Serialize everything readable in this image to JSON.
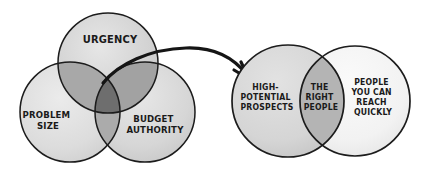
{
  "diagram": {
    "background_color": "#ffffff",
    "ink_color": "#1c1c1c",
    "left_venn": {
      "name": "qualification-criteria-venn",
      "circles": [
        {
          "id": "urgency",
          "label": "URGENCY",
          "lines": [
            "URGENCY"
          ],
          "fill": "#d2d2d2",
          "cx": 108,
          "cy": 63,
          "r": 50
        },
        {
          "id": "problem-size",
          "label": "PROBLEM SIZE",
          "lines": [
            "PROBLEM",
            "SIZE"
          ],
          "fill": "#dcdcdc",
          "cx": 70,
          "cy": 112,
          "r": 50
        },
        {
          "id": "budget-authority",
          "label": "BUDGET AUTHORITY",
          "lines": [
            "BUDGET",
            "AUTHORITY"
          ],
          "fill": "#d6d6d6",
          "cx": 145,
          "cy": 112,
          "r": 50
        }
      ],
      "overlap_fill": "#8e8e8e",
      "center_fill": "#6e6e6e"
    },
    "arrow": {
      "name": "flow-arrow",
      "from": "left-venn-center-intersection",
      "to": "right-venn-left-circle",
      "stroke_color": "#151515",
      "stroke_width": 3.2,
      "start_x": 103,
      "start_y": 83,
      "end_x": 248,
      "end_y": 78
    },
    "right_venn": {
      "name": "right-people-venn",
      "circles": [
        {
          "id": "high-potential-prospects",
          "label": "HIGH-POTENTIAL PROSPECTS",
          "lines": [
            "HIGH-",
            "POTENTIAL",
            "PROSPECTS"
          ],
          "fill": "#d5d5d5",
          "cx": 288,
          "cy": 101,
          "r": 56
        },
        {
          "id": "reach-quickly",
          "label": "PEOPLE YOU CAN REACH QUICKLY",
          "lines": [
            "PEOPLE",
            "YOU CAN",
            "REACH",
            "QUICKLY"
          ],
          "fill": "#f2f2f2",
          "cx": 355,
          "cy": 101,
          "r": 55
        }
      ],
      "intersection": {
        "id": "the-right-people",
        "label": "THE RIGHT PEOPLE",
        "lines": [
          "THE",
          "RIGHT",
          "PEOPLE"
        ],
        "fill": "#b4b4b4"
      }
    }
  }
}
